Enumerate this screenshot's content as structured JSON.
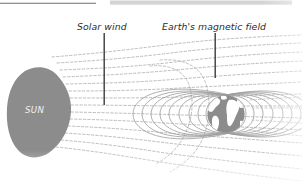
{
  "figure": {
    "width": 302,
    "height": 182,
    "background": "#ffffff",
    "type": "scientific-diagram"
  },
  "labels": {
    "solar_wind": "Solar wind",
    "earth_magnetic_field": "Earth's magnetic field",
    "sun": "SUN"
  },
  "colors": {
    "body_fill": "#8c8c8c",
    "continent_fill": "#ffffff",
    "field_line": "#9a9a9a",
    "stream_line": "#b4b4b4",
    "leader_line": "#3a3a3a",
    "rule_dark": "#6f6f6f",
    "rule_light": "#d2d2d2",
    "sun_text": "#f2f2f2",
    "label_text": "#2b2b2b"
  },
  "elements": {
    "sun": {
      "name": "SUN",
      "shape": "irregular-blob",
      "center_x": 38,
      "center_y": 113,
      "radius_x": 32,
      "radius_y": 45
    },
    "earth": {
      "name": "Earth",
      "shape": "circle",
      "center_x": 226,
      "center_y": 114,
      "radius": 19
    },
    "leader_lines": [
      {
        "target": "solar_wind",
        "x": 104,
        "y_top": 33,
        "y_bottom": 105
      },
      {
        "target": "earth_magnetic_field",
        "x": 215,
        "y_top": 33,
        "y_bottom": 78
      }
    ],
    "rules": [
      {
        "name": "top-dark-rule",
        "x1": 0,
        "x2": 96,
        "y": 3,
        "color": "#6f6f6f"
      },
      {
        "name": "top-light-band",
        "x1": 110,
        "x2": 292,
        "y": 2,
        "color": "#d2d2d2"
      }
    ],
    "solar_wind_streams": {
      "count": 14,
      "style": "dashed",
      "direction": "left-to-right",
      "description": "Dashed streamlines emanating from the Sun, deflected around the Earth's magnetosphere and drawn into a long tail"
    },
    "magnetosphere_loops": {
      "count": 9,
      "style": "solid",
      "description": "Nested closed dipole field loops surrounding the Earth"
    }
  }
}
